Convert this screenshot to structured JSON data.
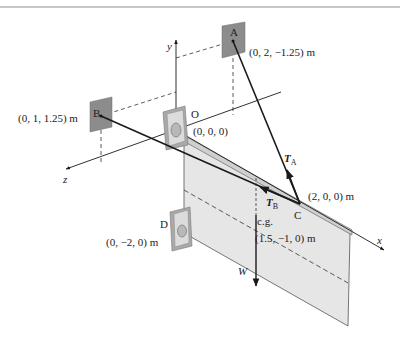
{
  "figure": {
    "axes": {
      "x": "x",
      "y": "y",
      "z": "z"
    },
    "points": {
      "A": {
        "name": "A",
        "coords": "(0, 2, −1.25) m"
      },
      "B": {
        "name": "B",
        "coords": "(0, 1, 1.25) m"
      },
      "O": {
        "name": "O",
        "coords": "(0, 0, 0)"
      },
      "C": {
        "name": "C",
        "coords": "(2, 0, 0) m"
      },
      "D": {
        "name": "D",
        "coords": "(0, −2, 0) m"
      },
      "cg": {
        "name": "c.g.",
        "coords": "(1.5, −1, 0) m"
      }
    },
    "forces": {
      "TA": {
        "symbol": "T",
        "subscript": "A"
      },
      "TB": {
        "symbol": "T",
        "subscript": "B"
      },
      "W": {
        "symbol": "W"
      }
    },
    "colors": {
      "line": "#1a1a1a",
      "bracket": "#8a8a8a",
      "plate_fill": "#e6e6e6",
      "plate_edge": "#555555",
      "border": "#b5b5b5"
    }
  }
}
